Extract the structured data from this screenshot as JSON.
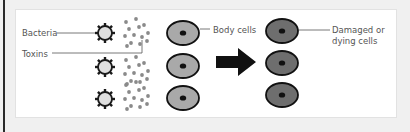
{
  "labels": {
    "bacteria": "Bacteria",
    "toxins": "Toxins",
    "body_cells": "Body cells",
    "damaged_line1": "Damaged or",
    "damaged_line2": "dying cells"
  },
  "colors": {
    "bacteria_fill": "#e0e0e0",
    "bacteria_outline": "#1a1a1a",
    "toxin": "#8a8a8a",
    "body_cell_fill": "#a9a9a9",
    "damaged_cell_fill": "#6e6e6e",
    "nucleus": "#111111",
    "arrow": "#111111",
    "leader_line": "#555555"
  }
}
